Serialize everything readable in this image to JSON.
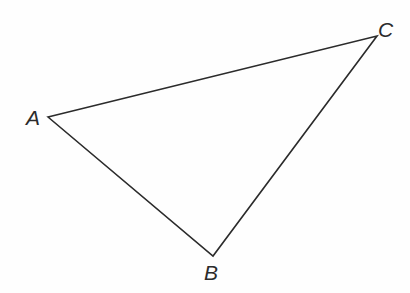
{
  "figure": {
    "kind": "triangle-diagram",
    "background_color": "#fefefe",
    "stroke_color": "#2b2b2b",
    "stroke_width": 1.6,
    "label_color": "#2b2b2b",
    "canvas": {
      "width": 410,
      "height": 293
    },
    "vertices": [
      {
        "id": "A",
        "label": "A",
        "x": 48,
        "y": 117,
        "label_x": 26,
        "label_y": 107
      },
      {
        "id": "B",
        "label": "B",
        "x": 213,
        "y": 256,
        "label_x": 204,
        "label_y": 262
      },
      {
        "id": "C",
        "label": "C",
        "x": 377,
        "y": 36,
        "label_x": 378,
        "label_y": 19
      }
    ],
    "edges": [
      {
        "id": "AC",
        "from": "A",
        "to": "C"
      },
      {
        "id": "AB",
        "from": "A",
        "to": "B"
      },
      {
        "id": "BC",
        "from": "B",
        "to": "C"
      }
    ],
    "path": "M 48 117 L 377 36 L 213 256 Z"
  }
}
